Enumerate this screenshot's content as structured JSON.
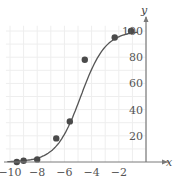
{
  "chart_data": {
    "type": "scatter",
    "title": "",
    "xlabel": "x",
    "ylabel": "y",
    "xlim": [
      -10,
      0
    ],
    "ylim": [
      0,
      100
    ],
    "grid": true,
    "x_ticks": [
      -10,
      -8,
      -6,
      -4,
      -2
    ],
    "y_ticks": [
      20,
      40,
      60,
      80,
      100
    ],
    "x_tick_labels": [
      "−10",
      "−8",
      "−6",
      "−4",
      "−2"
    ],
    "y_tick_labels": [
      "20",
      "40",
      "60",
      "80",
      "100"
    ],
    "series": [
      {
        "name": "data points",
        "type": "scatter",
        "points": [
          [
            -9.5,
            0
          ],
          [
            -9,
            1
          ],
          [
            -8,
            2
          ],
          [
            -6.6,
            18
          ],
          [
            -5.6,
            31
          ],
          [
            -4.5,
            78
          ],
          [
            -2.3,
            95
          ],
          [
            -1.1,
            100
          ]
        ]
      },
      {
        "name": "logistic fit",
        "type": "line",
        "model": "logistic",
        "L": 100,
        "k": 1.1,
        "x0": -4.8
      }
    ],
    "colors": {
      "points": "#4a4a4a",
      "curve": "#555555",
      "axes": "#7a7a7a",
      "grid": "#eeeeee"
    }
  }
}
